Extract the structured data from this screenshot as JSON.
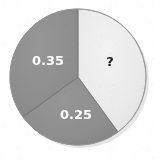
{
  "chart_data": {
    "type": "pie",
    "title": "",
    "subtitle": "",
    "xlabel": "",
    "ylabel": "",
    "legend_position": "none",
    "grid": false,
    "start_angle_deg": 0,
    "direction": "clockwise",
    "total": 1.0,
    "categories": [
      "?",
      "0.25",
      "0.35"
    ],
    "values": [
      0.4,
      0.25,
      0.35
    ],
    "labels": [
      "?",
      "0.25",
      "0.35"
    ],
    "slices": [
      {
        "id": "unknown",
        "label": "?",
        "value": 0.4,
        "value_known": false,
        "fill": "#e9e9e9",
        "label_color": "#1d1d1d",
        "start_deg": 0,
        "end_deg": 144,
        "label_x": 110,
        "label_y": 62,
        "font_size": 13
      },
      {
        "id": "slice-025",
        "label": "0.25",
        "value": 0.25,
        "value_known": true,
        "fill": "#8d8d8d",
        "label_color": "#ffffff",
        "start_deg": 144,
        "end_deg": 234,
        "label_x": 76,
        "label_y": 115,
        "font_size": 13
      },
      {
        "id": "slice-035",
        "label": "0.35",
        "value": 0.35,
        "value_known": true,
        "fill": "#8d8d8d",
        "label_color": "#ffffff",
        "start_deg": 234,
        "end_deg": 360,
        "label_x": 48,
        "label_y": 61,
        "font_size": 13
      }
    ],
    "geometry": {
      "center_x": 78,
      "center_y": 77,
      "radius": 68
    },
    "colors": {
      "background": "#ffffff",
      "light_slice": "#e9e9e9",
      "gray_slice": "#8d8d8d",
      "separator": "#6f6f6f",
      "outline": "#9a9a9a",
      "shadow": "#cfcfcf"
    }
  }
}
